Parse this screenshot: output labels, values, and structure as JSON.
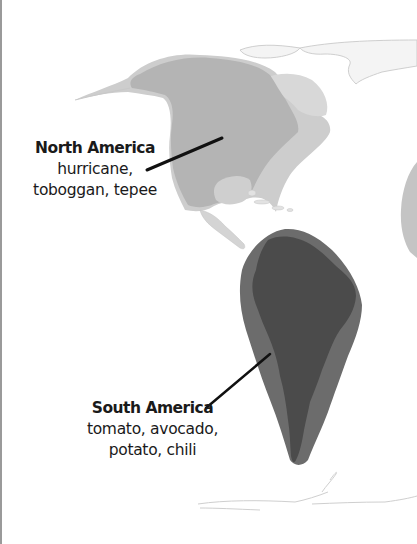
{
  "map": {
    "type": "world-region-map",
    "colors": {
      "background": "#ffffff",
      "na_outer": "#c9c9c9",
      "na_land": "#b3b3b3",
      "na_light_land": "#d4d4d4",
      "sa_outer": "#6a6a6a",
      "sa_land": "#4a4a4a",
      "other_land_outline": "#d8d8d8",
      "leader_line": "#111111"
    }
  },
  "regions": [
    {
      "name": "North America",
      "words": "hurricane,",
      "words2": "toboggan, tepee"
    },
    {
      "name": "South America",
      "words": "tomato, avocado,",
      "words2": "potato, chili"
    }
  ]
}
